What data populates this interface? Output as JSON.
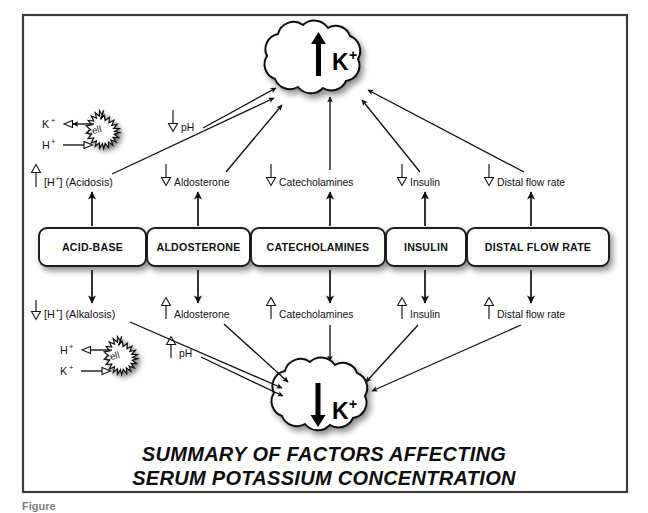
{
  "figure": {
    "title_line1": "SUMMARY OF FACTORS AFFECTING",
    "title_line2": "SERUM POTASSIUM CONCENTRATION",
    "caption": "Figure"
  },
  "nodes": {
    "increase_cloud": {
      "arrow": "up",
      "label": "K",
      "superscript": "+"
    },
    "decrease_cloud": {
      "arrow": "down",
      "label": "K",
      "superscript": "+"
    }
  },
  "factor_boxes": [
    {
      "id": "acid-base",
      "label": "ACID-BASE"
    },
    {
      "id": "aldosterone",
      "label": "ALDOSTERONE"
    },
    {
      "id": "catecholamines",
      "label": "CATECHOLAMINES"
    },
    {
      "id": "insulin",
      "label": "INSULIN"
    },
    {
      "id": "distal-flow-rate",
      "label": "DISTAL FLOW RATE"
    }
  ],
  "upper_effects": [
    {
      "id": "acidosis",
      "direction": "up",
      "label": "[H",
      "superscript": "+",
      "label_tail": "] (Acidosis)"
    },
    {
      "id": "aldosterone-down",
      "direction": "down",
      "label": "Aldosterone"
    },
    {
      "id": "catecholamines-down",
      "direction": "down",
      "label": "Catecholamines"
    },
    {
      "id": "insulin-down",
      "direction": "down",
      "label": "Insulin"
    },
    {
      "id": "distal-flow-down",
      "direction": "down",
      "label": "Distal flow rate"
    }
  ],
  "lower_effects": [
    {
      "id": "alkalosis",
      "direction": "down",
      "label": "[H",
      "superscript": "+",
      "label_tail": "] (Alkalosis)"
    },
    {
      "id": "aldosterone-up",
      "direction": "up",
      "label": "Aldosterone"
    },
    {
      "id": "catecholamines-up",
      "direction": "up",
      "label": "Catecholamines"
    },
    {
      "id": "insulin-up",
      "direction": "up",
      "label": "Insulin"
    },
    {
      "id": "distal-flow-up",
      "direction": "up",
      "label": "Distal flow rate"
    }
  ],
  "ph_markers": {
    "upper": {
      "direction": "down",
      "label": "pH"
    },
    "lower": {
      "direction": "up",
      "label": "pH"
    }
  },
  "cells": {
    "upper": {
      "name": "cell",
      "efflux_ion": "K",
      "efflux_sup": "+",
      "influx_ion": "H",
      "influx_sup": "+"
    },
    "lower": {
      "name": "cell",
      "efflux_ion": "H",
      "efflux_sup": "+",
      "influx_ion": "K",
      "influx_sup": "+"
    }
  },
  "colors": {
    "stroke": "#111111",
    "frame": "#3a3a3a",
    "background": "#ffffff",
    "caption": "#7d7d7d"
  }
}
